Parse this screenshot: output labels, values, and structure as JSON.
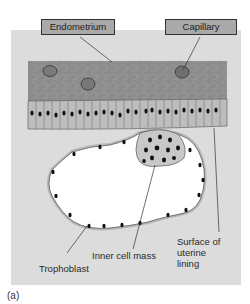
{
  "figure": {
    "caption": "(a)",
    "labels": {
      "endometrium": "Endometrium",
      "capillary": "Capillary",
      "inner_cell_mass": "Inner cell mass",
      "trophoblast": "Trophoblast",
      "surface_line1": "Surface of",
      "surface_line2": "uterine",
      "surface_line3": "lining"
    },
    "colors": {
      "panel_bg": "#dcdcdc",
      "tissue": "#8a8a8a",
      "epithelium": "#bdbdbd",
      "label_box": "#a9a9a9",
      "nucleus": "#111111"
    }
  }
}
